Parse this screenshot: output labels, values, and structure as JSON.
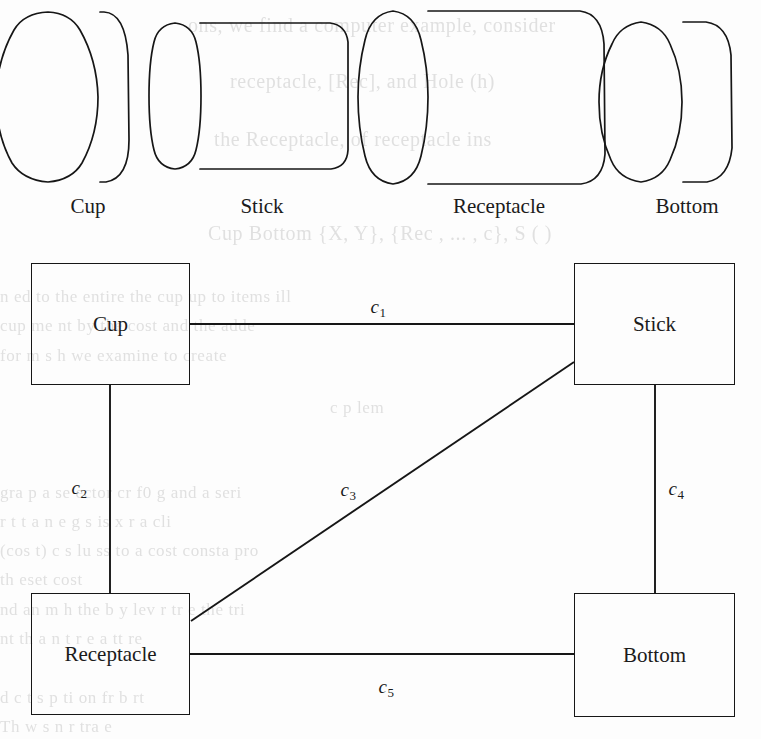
{
  "figure": {
    "kind": "scanned-technical-figure",
    "background_color": "#fdfdfd",
    "ink_color": "#161616",
    "ghost_text_color": "#c9c9c9"
  },
  "parts_row": {
    "items": [
      {
        "label": "Cup",
        "shape": "cylinder",
        "caption_center_x": 88,
        "caption_y": 196
      },
      {
        "label": "Stick",
        "shape": "cylinder",
        "caption_center_x": 262,
        "caption_y": 196
      },
      {
        "label": "Receptacle",
        "shape": "cylinder",
        "caption_center_x": 499,
        "caption_y": 196
      },
      {
        "label": "Bottom",
        "shape": "cylinder",
        "caption_center_x": 687,
        "caption_y": 196
      }
    ]
  },
  "graph": {
    "nodes": [
      {
        "id": "cup",
        "label": "Cup",
        "x": 31,
        "y": 263,
        "w": 159,
        "h": 122
      },
      {
        "id": "stick",
        "label": "Stick",
        "x": 574,
        "y": 263,
        "w": 161,
        "h": 122
      },
      {
        "id": "receptacle",
        "label": "Receptacle",
        "x": 31,
        "y": 593,
        "w": 159,
        "h": 122
      },
      {
        "id": "bottom",
        "label": "Bottom",
        "x": 574,
        "y": 593,
        "w": 161,
        "h": 124
      }
    ],
    "edges": [
      {
        "id": "c1",
        "label": "c",
        "subscript": "1",
        "from": "cup",
        "to": "stick",
        "label_x": 378,
        "label_y": 306
      },
      {
        "id": "c2",
        "label": "c",
        "subscript": "2",
        "from": "cup",
        "to": "receptacle",
        "label_x": 79,
        "label_y": 487
      },
      {
        "id": "c3",
        "label": "c",
        "subscript": "3",
        "from": "receptacle",
        "to": "stick",
        "label_x": 348,
        "label_y": 489
      },
      {
        "id": "c4",
        "label": "c",
        "subscript": "4",
        "from": "stick",
        "to": "bottom",
        "label_x": 676,
        "label_y": 488
      },
      {
        "id": "c5",
        "label": "c",
        "subscript": "5",
        "from": "receptacle",
        "to": "bottom",
        "label_x": 386,
        "label_y": 686
      }
    ]
  },
  "ghost_text": [
    {
      "text": "ons, we find a computer example, consider",
      "x": 188,
      "y": 14,
      "size": 20
    },
    {
      "text": "receptacle, [Rec], and Hole (h)",
      "x": 230,
      "y": 70,
      "size": 20
    },
    {
      "text": "the Receptacle,  of receptacle ins",
      "x": 214,
      "y": 128,
      "size": 20
    },
    {
      "text": "Cup Bottom   {X, Y}, {Rec  , ... , c},  S   ( )",
      "x": 208,
      "y": 222,
      "size": 20
    },
    {
      "text": "n  ed to the entire the cup   up  to  items   ill",
      "x": 0,
      "y": 287,
      "size": 17
    },
    {
      "text": "cup  me  nt  by  the  cost  and   the   adde",
      "x": 0,
      "y": 316,
      "size": 17
    },
    {
      "text": "for   m   s   h   we examine to create",
      "x": 0,
      "y": 346,
      "size": 17
    },
    {
      "text": "c   p  lem",
      "x": 330,
      "y": 398,
      "size": 17
    },
    {
      "text": "gra  p  a  se  ector  cr    f0    g  and   a   seri",
      "x": 0,
      "y": 483,
      "size": 17
    },
    {
      "text": "r   t  t   a     n   e   g   s  is   x   r    a   cli",
      "x": 0,
      "y": 512,
      "size": 17
    },
    {
      "text": "(cos t)    c  s   lu  ss  to  a   cost   consta  pro",
      "x": 0,
      "y": 541,
      "size": 17
    },
    {
      "text": "th    eset   cost",
      "x": 0,
      "y": 570,
      "size": 17
    },
    {
      "text": "nd an  m   h  the  b  y  lev  r  tr  e the   tri",
      "x": 0,
      "y": 600,
      "size": 17
    },
    {
      "text": "nt  th   a n  t r  e   a   tt  re",
      "x": 0,
      "y": 629,
      "size": 17
    },
    {
      "text": "d    c   t   s   p   ti   on   fr   b   rt",
      "x": 0,
      "y": 688,
      "size": 17
    },
    {
      "text": "Th   w   s   n   r    tra  e",
      "x": 0,
      "y": 717,
      "size": 17
    }
  ]
}
